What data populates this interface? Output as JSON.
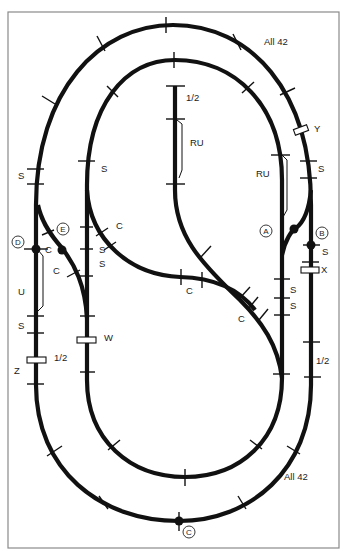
{
  "diagram": {
    "colors": {
      "track": "#111111",
      "frame": "#8a8a8a",
      "background": "#ffffff"
    },
    "labels": {
      "outer_curve_top": "All 42",
      "outer_curve_bottom": "All 42",
      "center_siding_half": "1/2",
      "center_siding_ru": "RU",
      "right_siding_ru": "RU",
      "y": "Y",
      "x": "X",
      "w": "W",
      "z": "Z",
      "u": "U",
      "left_half": "1/2",
      "right_half": "1/2",
      "s_left_outer_top": "S",
      "s_left_inner_top": "S",
      "s_left_outer_bottom": "S",
      "s_right_outer_top": "S",
      "s_right_b": "S",
      "s_inner_left_1": "S",
      "s_inner_left_2": "S",
      "s_right_inner_1": "S",
      "s_right_inner_2": "S",
      "c_d": "C",
      "c_e": "C",
      "c_inner_left": "C",
      "c_center": "C",
      "c_right_lower": "C"
    },
    "junctions": [
      {
        "id": "A",
        "label": "A"
      },
      {
        "id": "B",
        "label": "B"
      },
      {
        "id": "C",
        "label": "C"
      },
      {
        "id": "D",
        "label": "D"
      },
      {
        "id": "E",
        "label": "E"
      }
    ]
  }
}
